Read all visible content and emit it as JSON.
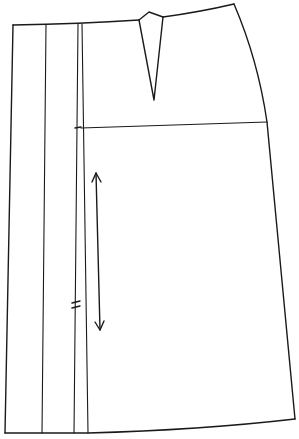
{
  "diagram": {
    "type": "sewing-pattern-piece",
    "colors": {
      "line": "#1a1a1a",
      "background": "#ffffff"
    },
    "outline": {
      "points": [
        [
          13,
          25
        ],
        [
          139,
          20
        ],
        [
          149,
          12
        ],
        [
          163,
          17
        ],
        [
          234,
          4
        ],
        [
          250,
          60
        ],
        [
          267,
          122
        ],
        [
          295,
          419
        ],
        [
          200,
          428
        ],
        [
          88,
          433
        ],
        [
          5,
          433
        ]
      ]
    },
    "waist_curve": {
      "from": [
        13,
        25
      ],
      "to": [
        234,
        4
      ]
    },
    "dart": {
      "left": [
        139,
        20
      ],
      "peak": [
        149,
        12
      ],
      "right": [
        163,
        17
      ],
      "tip": [
        154,
        100
      ]
    },
    "hip_line": {
      "from": [
        81,
        128
      ],
      "to": [
        267,
        122
      ],
      "tick": [
        77,
        127
      ]
    },
    "vertical_lines": [
      {
        "name": "pleat-line-1",
        "top": [
          46,
          25
        ],
        "bottom": [
          42,
          433
        ]
      },
      {
        "name": "pleat-line-2",
        "top": [
          78,
          24
        ],
        "bottom": [
          74,
          433
        ]
      },
      {
        "name": "pleat-line-3",
        "top": [
          82,
          24
        ],
        "bottom": [
          88,
          433
        ]
      }
    ],
    "grainline": {
      "top": [
        96,
        173
      ],
      "bottom": [
        100,
        330
      ]
    },
    "notch": {
      "position": [
        76,
        305
      ],
      "count": 2
    }
  }
}
